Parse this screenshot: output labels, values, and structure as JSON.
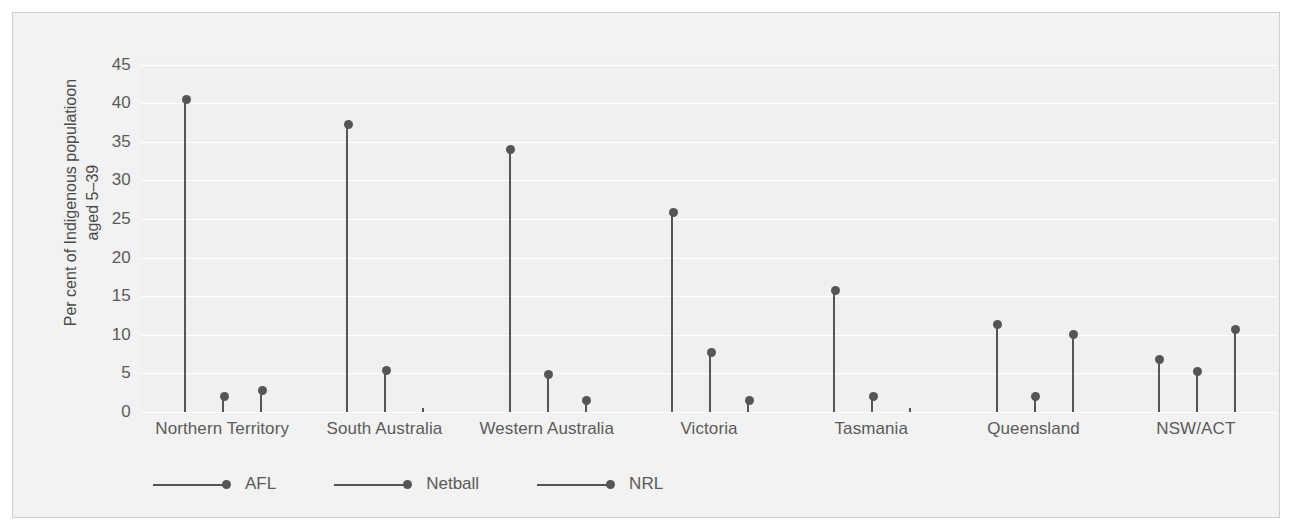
{
  "chart_data": {
    "type": "line",
    "plot_style": "stem/lollipop, grouped by state",
    "title": "",
    "subtitle": "",
    "xlabel": "",
    "ylabel": "Per cent of Indigenous populatioon aged 5–39",
    "ylabel_lines": [
      "Per cent of Indigenous  populatioon",
      "aged 5–39"
    ],
    "ylim": [
      0,
      46
    ],
    "yticks": [
      0,
      5,
      10,
      15,
      20,
      25,
      30,
      35,
      40,
      45
    ],
    "ytick_labels": [
      "0",
      "5",
      "10",
      "15",
      "20",
      "25",
      "30",
      "35",
      "40",
      "45"
    ],
    "grid": true,
    "grid_color": "#ffffff",
    "panel_bg": "#f0f0f0",
    "marker_color": "#555555",
    "legend_position": "bottom-left",
    "categories": [
      "Northern Territory",
      "South Australia",
      "Western Australia",
      "Victoria",
      "Tasmania",
      "Queensland",
      "NSW/ACT"
    ],
    "series": [
      {
        "name": "AFL",
        "values": [
          40.5,
          37.2,
          34.0,
          25.9,
          15.8,
          11.3,
          6.8
        ]
      },
      {
        "name": "Netball",
        "values": [
          2.0,
          5.4,
          4.9,
          7.7,
          2.0,
          2.0,
          5.2
        ]
      },
      {
        "name": "NRL",
        "values": [
          2.8,
          0.5,
          1.5,
          1.5,
          0.5,
          10.1,
          10.7
        ]
      }
    ]
  },
  "legend": {
    "items": [
      {
        "label": "AFL"
      },
      {
        "label": "Netball"
      },
      {
        "label": "NRL"
      }
    ]
  }
}
